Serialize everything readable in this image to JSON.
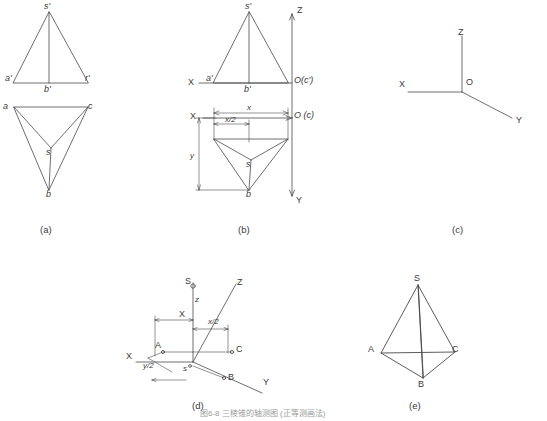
{
  "figure": {
    "stroke_color": "#4a4a4a",
    "background": "#ffffff"
  },
  "panels": [
    {
      "id": "a",
      "caption": "(a)"
    },
    {
      "id": "b",
      "caption": "(b)"
    },
    {
      "id": "c",
      "caption": "(c)"
    },
    {
      "id": "d",
      "caption": "(d)"
    },
    {
      "id": "e",
      "caption": "(e)"
    }
  ],
  "panel_a": {
    "front_view_labels": [
      {
        "text": "s'",
        "x": 44,
        "y": 5
      },
      {
        "text": "a'",
        "x": 7,
        "y": 80
      },
      {
        "text": "b'",
        "x": 44,
        "y": 89
      },
      {
        "text": "r'",
        "x": 83,
        "y": 80
      }
    ],
    "top_view_labels": [
      {
        "text": "a",
        "x": 7,
        "y": 113
      },
      {
        "text": "c",
        "x": 84,
        "y": 113
      },
      {
        "text": "s",
        "x": 46,
        "y": 143
      },
      {
        "text": "b",
        "x": 44,
        "y": 193
      }
    ],
    "caption": "(a)",
    "caption_pos": {
      "x": 40,
      "y": 228
    }
  },
  "panel_b": {
    "axis_labels": [
      {
        "text": "Z",
        "x": 296,
        "y": 5
      },
      {
        "text": "X",
        "x": 188,
        "y": 83
      },
      {
        "text": "Y",
        "x": 294,
        "y": 197
      },
      {
        "text": "O(c')",
        "x": 272,
        "y": 83
      },
      {
        "text": "O (c)",
        "x": 272,
        "y": 118
      }
    ],
    "view_labels": [
      {
        "text": "s'",
        "x": 244,
        "y": 5
      },
      {
        "text": "a'",
        "x": 209,
        "y": 80
      },
      {
        "text": "b'",
        "x": 241,
        "y": 89
      },
      {
        "text": "X",
        "x": 193,
        "y": 118
      },
      {
        "text": "x",
        "x": 243,
        "y": 112
      },
      {
        "text": "y",
        "x": 192,
        "y": 155
      },
      {
        "text": "x/2",
        "x": 215,
        "y": 128
      },
      {
        "text": "s",
        "x": 244,
        "y": 155
      },
      {
        "text": "b",
        "x": 240,
        "y": 190
      }
    ],
    "caption": "(b)",
    "caption_pos": {
      "x": 238,
      "y": 228
    }
  },
  "panel_c": {
    "axis_labels": [
      {
        "text": "Z",
        "x": 458,
        "y": 32
      },
      {
        "text": "X",
        "x": 399,
        "y": 84
      },
      {
        "text": "O",
        "x": 466,
        "y": 82
      },
      {
        "text": "Y",
        "x": 517,
        "y": 102
      }
    ],
    "caption": "(c)",
    "caption_pos": {
      "x": 452,
      "y": 228
    }
  },
  "panel_d": {
    "axis_labels": [
      {
        "text": "Z",
        "x": 237,
        "y": 278
      },
      {
        "text": "X",
        "x": 126,
        "y": 348
      },
      {
        "text": "Y",
        "x": 265,
        "y": 378
      },
      {
        "text": "O",
        "x": 185,
        "y": 349
      }
    ],
    "point_labels": [
      {
        "text": "S",
        "x": 189,
        "y": 277
      },
      {
        "text": "z",
        "x": 190,
        "y": 292
      },
      {
        "text": "X",
        "x": 183,
        "y": 312
      },
      {
        "text": "x/2",
        "x": 214,
        "y": 321
      },
      {
        "text": "C",
        "x": 236,
        "y": 348
      },
      {
        "text": "A",
        "x": 152,
        "y": 345
      },
      {
        "text": "y/2",
        "x": 146,
        "y": 365
      },
      {
        "text": "s",
        "x": 185,
        "y": 363
      },
      {
        "text": "B",
        "x": 229,
        "y": 377
      }
    ],
    "caption": "(d)",
    "caption_pos": {
      "x": 192,
      "y": 404
    }
  },
  "panel_e": {
    "vertex_labels": [
      {
        "text": "S",
        "x": 414,
        "y": 278
      },
      {
        "text": "A",
        "x": 370,
        "y": 348
      },
      {
        "text": "C",
        "x": 450,
        "y": 348
      },
      {
        "text": "B",
        "x": 411,
        "y": 382
      }
    ],
    "caption": "(e)",
    "caption_pos": {
      "x": 409,
      "y": 404
    }
  },
  "footer": {
    "text": "图6-8 三棱锥的轴测图 (正等测画法)",
    "x": 200,
    "y": 414
  }
}
